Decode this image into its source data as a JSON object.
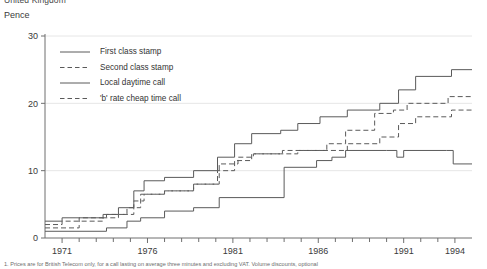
{
  "header": {
    "clipped_title": "United Kingdom",
    "unit_label": "Pence"
  },
  "footnote": {
    "text": "1. Prices are for British Telecom only, for a call lasting on average three minutes and excluding VAT. Volume discounts, optional"
  },
  "legend": {
    "position": "top-left-inside",
    "entries": [
      {
        "label": "First class stamp",
        "style": "solid",
        "name": "legend-first-class-stamp"
      },
      {
        "label": "Second class stamp",
        "style": "dashed",
        "name": "legend-second-class-stamp"
      },
      {
        "label": "Local daytime call",
        "style": "solid",
        "name": "legend-local-daytime-call"
      },
      {
        "label": "'b' rate cheap time call",
        "style": "dashed",
        "name": "legend-b-rate-cheap-time-call"
      }
    ]
  },
  "chart_data": {
    "type": "line",
    "title": "Pence",
    "xlabel": "",
    "ylabel": "Pence",
    "xlim": [
      1970.0,
      1995.0
    ],
    "ylim": [
      0,
      30
    ],
    "yticks": [
      0,
      10,
      20,
      30
    ],
    "xticks": [
      1971,
      1976,
      1981,
      1986,
      1991,
      1994
    ],
    "xtick_labels": [
      "1971",
      "1976",
      "1981",
      "1986",
      "1991",
      "1994"
    ],
    "minor_xticks": [
      1972,
      1973,
      1974,
      1975,
      1977,
      1978,
      1979,
      1980,
      1982,
      1983,
      1984,
      1985,
      1987,
      1988,
      1989,
      1990,
      1992,
      1993
    ],
    "grid": "horizontal",
    "step_type": "post",
    "series": [
      {
        "name": "First class stamp",
        "style": "solid",
        "points": [
          [
            1970.0,
            2.5
          ],
          [
            1971.0,
            3.0
          ],
          [
            1973.4,
            3.5
          ],
          [
            1974.3,
            4.5
          ],
          [
            1975.2,
            7.0
          ],
          [
            1975.8,
            8.5
          ],
          [
            1977.0,
            9.0
          ],
          [
            1978.7,
            10.0
          ],
          [
            1980.1,
            12.0
          ],
          [
            1981.1,
            14.0
          ],
          [
            1982.1,
            15.5
          ],
          [
            1983.8,
            16.0
          ],
          [
            1984.8,
            17.0
          ],
          [
            1986.1,
            18.0
          ],
          [
            1987.7,
            19.0
          ],
          [
            1989.6,
            20.0
          ],
          [
            1990.7,
            22.0
          ],
          [
            1991.7,
            24.0
          ],
          [
            1993.8,
            25.0
          ],
          [
            1995.0,
            25.0
          ]
        ]
      },
      {
        "name": "Second class stamp",
        "style": "dashed",
        "points": [
          [
            1970.0,
            2.0
          ],
          [
            1971.0,
            2.5
          ],
          [
            1973.4,
            3.0
          ],
          [
            1974.3,
            3.5
          ],
          [
            1975.2,
            5.5
          ],
          [
            1975.8,
            6.5
          ],
          [
            1977.0,
            7.0
          ],
          [
            1978.7,
            8.0
          ],
          [
            1980.1,
            10.0
          ],
          [
            1981.1,
            11.5
          ],
          [
            1982.1,
            12.5
          ],
          [
            1983.8,
            12.5
          ],
          [
            1984.8,
            13.0
          ],
          [
            1986.1,
            13.0
          ],
          [
            1987.7,
            14.0
          ],
          [
            1989.6,
            15.0
          ],
          [
            1990.7,
            17.0
          ],
          [
            1991.7,
            18.0
          ],
          [
            1993.8,
            19.0
          ],
          [
            1995.0,
            19.0
          ]
        ]
      },
      {
        "name": "Local daytime call",
        "style": "solid",
        "points": [
          [
            1970.0,
            1.0
          ],
          [
            1973.6,
            1.5
          ],
          [
            1974.8,
            2.5
          ],
          [
            1975.6,
            3.0
          ],
          [
            1977.0,
            4.0
          ],
          [
            1978.7,
            4.5
          ],
          [
            1980.2,
            6.0
          ],
          [
            1984.0,
            10.5
          ],
          [
            1985.9,
            11.5
          ],
          [
            1986.8,
            12.0
          ],
          [
            1987.6,
            13.0
          ],
          [
            1990.0,
            13.0
          ],
          [
            1990.6,
            12.0
          ],
          [
            1991.0,
            13.0
          ],
          [
            1993.5,
            13.0
          ],
          [
            1993.9,
            11.0
          ],
          [
            1995.0,
            11.0
          ]
        ]
      },
      {
        "name": "'b' rate cheap time call",
        "style": "dashed",
        "points": [
          [
            1970.0,
            1.5
          ],
          [
            1972.0,
            3.0
          ],
          [
            1973.6,
            3.5
          ],
          [
            1974.8,
            4.5
          ],
          [
            1975.6,
            6.5
          ],
          [
            1977.0,
            7.0
          ],
          [
            1978.7,
            8.0
          ],
          [
            1980.2,
            11.0
          ],
          [
            1981.3,
            12.0
          ],
          [
            1982.2,
            12.5
          ],
          [
            1983.9,
            13.0
          ],
          [
            1985.0,
            13.0
          ],
          [
            1986.5,
            14.0
          ],
          [
            1987.6,
            16.0
          ],
          [
            1989.3,
            18.5
          ],
          [
            1990.4,
            19.0
          ],
          [
            1991.2,
            20.0
          ],
          [
            1993.6,
            21.0
          ],
          [
            1995.0,
            21.0
          ]
        ]
      }
    ]
  }
}
